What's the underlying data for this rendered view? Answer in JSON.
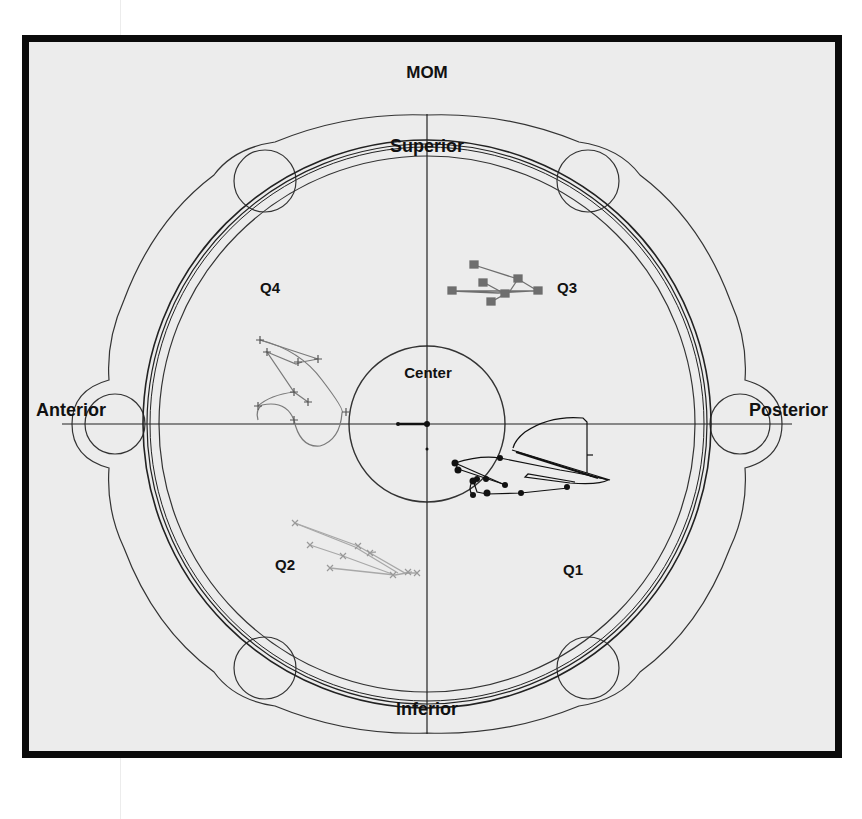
{
  "diagram": {
    "title": "MOM",
    "orientation_labels": {
      "top": "Superior",
      "bottom": "Inferior",
      "left": "Anterior",
      "right": "Posterior",
      "center": "Center"
    },
    "quadrants": {
      "q1": "Q1",
      "q2": "Q2",
      "q3": "Q3",
      "q4": "Q4"
    },
    "colors": {
      "frame": "#0b0b0b",
      "background": "#ececec",
      "outline": "#333333",
      "q1_trace": "#111111",
      "q2_trace": "#a8a8a8",
      "q3_trace": "#6e6e6e",
      "q4_trace": "#7a7a7a"
    },
    "markers": {
      "q1": "filled-circle",
      "q2": "x-cross",
      "q3": "filled-square",
      "q4": "plus"
    }
  }
}
